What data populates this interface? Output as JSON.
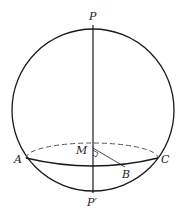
{
  "diagram": {
    "labels": {
      "P": "P",
      "P_prime": "P′",
      "M": "M",
      "A": "A",
      "B": "B",
      "C": "C"
    },
    "colors": {
      "stroke": "#1a1a1a",
      "dashed": "#555555",
      "background": "#ffffff"
    }
  }
}
